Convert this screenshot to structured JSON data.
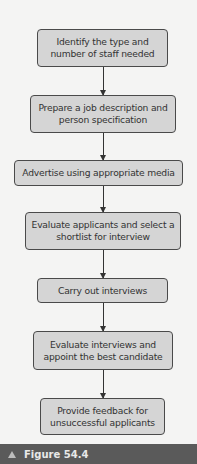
{
  "diagram": {
    "steps": [
      {
        "label": "Identify the type and number of staff needed"
      },
      {
        "label": "Prepare a job description and person specification"
      },
      {
        "label": "Advertise using appropriate media"
      },
      {
        "label": "Evaluate applicants and select a shortlist for interview"
      },
      {
        "label": "Carry out interviews"
      },
      {
        "label": "Evaluate interviews and appoint the best candidate"
      },
      {
        "label": "Provide feedback for unsuccessful applicants"
      }
    ]
  },
  "caption": {
    "icon": "triangle-up-icon",
    "label": "Figure 54.4"
  },
  "colors": {
    "box_fill": "#d5d5d5",
    "box_border": "#4a4a4a",
    "caption_bar": "#5a5a5a"
  }
}
